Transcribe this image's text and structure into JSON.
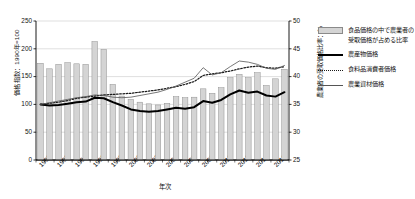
{
  "chart_data": {
    "type": "bar",
    "title": "",
    "xlabel": "年次",
    "ylabel": "価格指数：1990年=100",
    "ylabel_right": "農業者の受取価格比率：％",
    "ylim": [
      0,
      250
    ],
    "ylim_right": [
      25,
      50
    ],
    "grid": true,
    "legend_position": "right",
    "x": [
      1990,
      1991,
      1992,
      1993,
      1994,
      1995,
      1996,
      1997,
      1998,
      1999,
      2000,
      2001,
      2002,
      2003,
      2004,
      2005,
      2006,
      2007,
      2008,
      2009,
      2010,
      2011,
      2012,
      2013,
      2014,
      2015,
      2016,
      2017
    ],
    "yticks_left": [
      0,
      50,
      100,
      150,
      200,
      250
    ],
    "yticks_right": [
      25,
      30,
      35,
      40,
      45,
      50
    ],
    "xticks": [
      1990,
      1992,
      1994,
      1996,
      1998,
      2000,
      2002,
      2004,
      2006,
      2008,
      2010,
      2012,
      2014,
      2016
    ],
    "series": [
      {
        "name": "食品価格の中で農業者の受取価格が占める比率",
        "type": "bar",
        "axis": "right",
        "color": "#d4d4d4",
        "edge_color": "#8a8a8a",
        "values": [
          42.4,
          41.4,
          42.2,
          42.5,
          42.3,
          42.2,
          46.3,
          44.9,
          38.6,
          36.5,
          35.9,
          35.4,
          35.1,
          34.9,
          35.2,
          36.4,
          36.2,
          36.3,
          37.8,
          37.0,
          38.0,
          39.8,
          40.4,
          39.8,
          40.7,
          38.4,
          39.6,
          41.3
        ]
      },
      {
        "name": "農産物価格",
        "type": "line",
        "axis": "left",
        "color": "#000000",
        "style": "solid-thick",
        "values": [
          100,
          98,
          99,
          101,
          104,
          105,
          112,
          111,
          104,
          98,
          91,
          88,
          87,
          88,
          91,
          94,
          92,
          95,
          106,
          103,
          108,
          118,
          125,
          121,
          123,
          116,
          114,
          122
        ]
      },
      {
        "name": "食料品消費者価格",
        "type": "line",
        "axis": "left",
        "color": "#1a1a1a",
        "style": "dotted",
        "values": [
          100,
          102,
          104,
          107,
          111,
          113,
          115,
          117,
          118,
          119,
          120,
          122,
          124,
          126,
          129,
          132,
          136,
          141,
          152,
          155,
          157,
          160,
          164,
          167,
          169,
          166,
          165,
          168
        ]
      },
      {
        "name": "農業資材価格",
        "type": "line",
        "axis": "left",
        "color": "#555555",
        "style": "solid-thin",
        "values": [
          100,
          103,
          106,
          109,
          112,
          114,
          117,
          116,
          113,
          112,
          113,
          116,
          119,
          122,
          127,
          133,
          140,
          147,
          166,
          153,
          157,
          168,
          178,
          176,
          172,
          165,
          163,
          170
        ]
      }
    ]
  },
  "axes": {
    "left_title": "価格指数：1990年=100",
    "right_title": "農業者の受取価格比率：％",
    "x_title": "年次"
  },
  "legend": {
    "items": [
      {
        "label": "食品価格の中で農業者の受取価格が占める比率",
        "key": "bar"
      },
      {
        "label": "農産物価格",
        "key": "thick-line"
      },
      {
        "label": "食料品消費者価格",
        "key": "dotted-line"
      },
      {
        "label": "農業資材価格",
        "key": "thin-line"
      }
    ]
  }
}
